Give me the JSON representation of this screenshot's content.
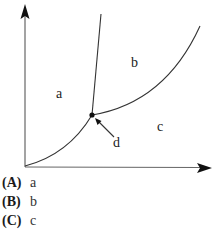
{
  "diagram": {
    "type": "phase-diagram",
    "regions": [
      {
        "id": "a",
        "label": "a",
        "x": 59,
        "y": 98
      },
      {
        "id": "b",
        "label": "b",
        "x": 135,
        "y": 67
      },
      {
        "id": "c",
        "label": "c",
        "x": 160,
        "y": 131
      }
    ],
    "pointer": {
      "label": "d",
      "x": 117,
      "y": 147
    },
    "colors": {
      "line": "#333333",
      "axis": "#555555",
      "arrowhead": "#111111"
    }
  },
  "options": [
    {
      "letter": "(A)",
      "text": "a"
    },
    {
      "letter": "(B)",
      "text": "b"
    },
    {
      "letter": "(C)",
      "text": "c"
    }
  ]
}
